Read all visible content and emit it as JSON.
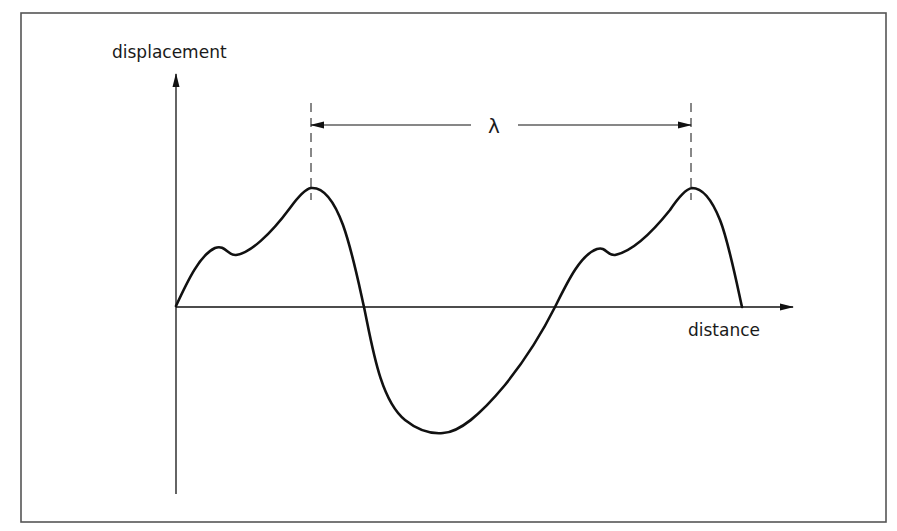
{
  "diagram": {
    "type": "wave-displacement-vs-distance",
    "y_axis_label": "displacement",
    "x_axis_label": "distance",
    "wavelength_symbol": "λ",
    "colors": {
      "stroke": "#111111",
      "border": "#555555",
      "background": "#ffffff"
    },
    "features": {
      "peaks": 2,
      "troughs": 1,
      "wavelength_marker": "double-headed arrow between dashed lines at successive peaks"
    }
  }
}
